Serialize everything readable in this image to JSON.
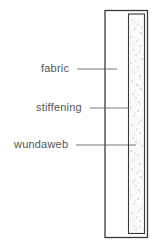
{
  "diagram": {
    "type": "labelled cross-section",
    "labels": [
      {
        "id": "fabric",
        "text": "fabric"
      },
      {
        "id": "stiffening",
        "text": "stiffening"
      },
      {
        "id": "wundaweb",
        "text": "wundaweb"
      }
    ],
    "colors": {
      "outline": "#3a3a3a",
      "label_text": "#555555",
      "leader_line": "#555555",
      "stipple": "#777777",
      "background": "#ffffff"
    }
  }
}
